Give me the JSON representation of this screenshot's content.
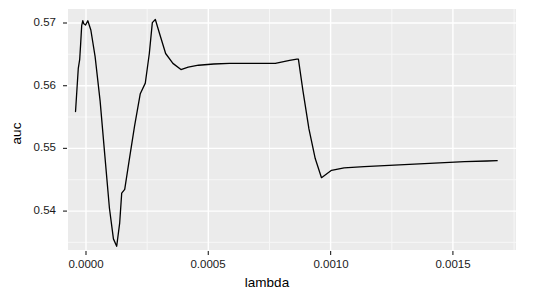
{
  "chart_data": {
    "type": "line",
    "title": "",
    "subtitle": "",
    "xlabel": "lambda",
    "ylabel": "auc",
    "xlim": [
      -3e-05,
      0.001755
    ],
    "ylim": [
      0.5322,
      0.5712
    ],
    "xticks": [
      0.0,
      0.0005,
      0.001,
      0.0015
    ],
    "xticklabels": [
      "0.0000",
      "0.0005",
      "0.0010",
      "0.0015"
    ],
    "yticks": [
      0.54,
      0.55,
      0.56,
      0.57
    ],
    "yticklabels": [
      "0.54",
      "0.55",
      "0.56",
      "0.57"
    ],
    "grid": true,
    "grid_major_color": "#ffffff",
    "grid_minor_color": "#f7f7f7",
    "panel_background": "#ebebeb",
    "line_color": "#000000",
    "line_width": 1.3,
    "legend": null,
    "legend_position": "none",
    "series": [
      {
        "name": "auc",
        "x": [
          0.0,
          1.1e-05,
          1.65e-05,
          2.05e-05,
          2.45e-05,
          2.9e-05,
          3.3e-05,
          4e-05,
          4.9e-05,
          6.1e-05,
          7.8e-05,
          9.8e-05,
          0.000117,
          0.000135,
          0.000151,
          0.000164,
          0.000176,
          0.000184,
          0.000196,
          0.000213,
          0.000235,
          0.000258,
          0.000278,
          0.000294,
          0.000306,
          0.000318,
          0.000335,
          0.000359,
          0.000388,
          0.00042,
          0.000449,
          0.00049,
          0.000551,
          0.000613,
          0.000674,
          0.000736,
          0.000796,
          0.000853,
          0.000882,
          0.000888,
          0.000906,
          0.00093,
          0.000955,
          0.00098,
          0.00102,
          0.00107,
          0.00115,
          0.00125,
          0.00135,
          0.00145,
          0.00155,
          0.00164,
          0.00168
        ],
        "values": [
          0.5546,
          0.5616,
          0.563,
          0.5656,
          0.5685,
          0.5693,
          0.5688,
          0.5686,
          0.5693,
          0.5678,
          0.5635,
          0.5563,
          0.5474,
          0.539,
          0.534,
          0.5328,
          0.5366,
          0.5414,
          0.542,
          0.5465,
          0.5522,
          0.5575,
          0.5592,
          0.564,
          0.569,
          0.5695,
          0.5672,
          0.564,
          0.5624,
          0.5614,
          0.5618,
          0.5621,
          0.5623,
          0.5624,
          0.5624,
          0.5624,
          0.5624,
          0.5629,
          0.5631,
          0.5631,
          0.558,
          0.5518,
          0.547,
          0.5439,
          0.5451,
          0.5455,
          0.5457,
          0.5459,
          0.5461,
          0.5463,
          0.5465,
          0.5466,
          0.54665
        ]
      }
    ]
  }
}
